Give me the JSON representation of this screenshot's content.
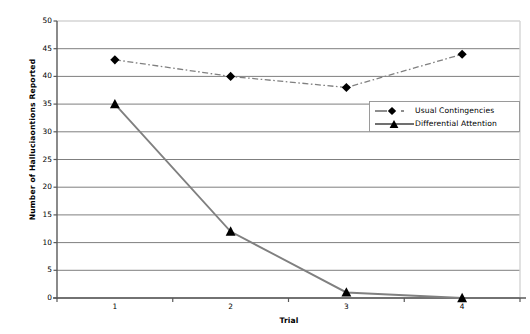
{
  "chart_data": {
    "type": "line",
    "title": "",
    "xlabel": "Trial",
    "ylabel": "Number of Halluciaontions Reported",
    "categories": [
      "1",
      "2",
      "3",
      "4"
    ],
    "x": [
      1,
      2,
      3,
      4
    ],
    "ylim": [
      0,
      50
    ],
    "ytick_labels": [
      "0",
      "5",
      "10",
      "15",
      "20",
      "25",
      "30",
      "35",
      "40",
      "45",
      "50"
    ],
    "ytick_values": [
      0,
      5,
      10,
      15,
      20,
      25,
      30,
      35,
      40,
      45,
      50
    ],
    "grid": "horizontal",
    "legend_position": "upper-right-inside",
    "series": [
      {
        "name": "Usual Contingencies",
        "values": [
          43,
          40,
          38,
          44
        ],
        "marker": "diamond",
        "line_style": "dash-dot",
        "color": "#000000",
        "line_color": "#808080"
      },
      {
        "name": "Differential Attention",
        "values": [
          35,
          12,
          1,
          0
        ],
        "marker": "triangle",
        "line_style": "solid",
        "color": "#000000",
        "line_color": "#808080"
      }
    ]
  },
  "axes": {
    "y_title": "Number of Halluciaontions Reported",
    "x_title": "Trial"
  },
  "legend": {
    "items": [
      {
        "label": "Usual Contingencies"
      },
      {
        "label": "Differential Attention"
      }
    ]
  },
  "colors": {
    "gridline": "#7f7f7f",
    "axis": "#595959",
    "plot_border_top": "#d4d4d4",
    "plot_border_right": "#d4d4d4",
    "series_line": "#808080",
    "marker": "#000000",
    "legend_border": "#9a9a9a",
    "background": "#ffffff"
  }
}
